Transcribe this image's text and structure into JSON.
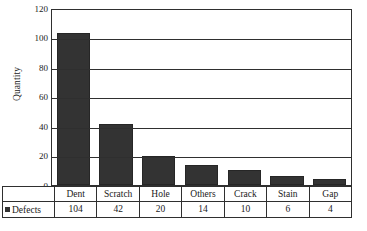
{
  "chart_data": {
    "type": "bar",
    "title": "",
    "xlabel": "",
    "ylabel": "Quantity",
    "categories": [
      "Dent",
      "Scratch",
      "Hole",
      "Others",
      "Crack",
      "Stain",
      "Gap"
    ],
    "values": [
      104,
      42,
      20,
      14,
      10,
      6,
      4
    ],
    "series": [
      {
        "name": "Defects",
        "values": [
          104,
          42,
          20,
          14,
          10,
          6,
          4
        ]
      }
    ],
    "ylim": [
      0,
      120
    ],
    "yticks": [
      0,
      20,
      40,
      60,
      80,
      100,
      120
    ],
    "ytick_labels": [
      "0",
      "20",
      "40",
      "60",
      "80",
      "100",
      "120"
    ],
    "grid": true,
    "grid_axis": "y",
    "legend": {
      "position": "data-table-row-header",
      "entries": [
        {
          "label": "Defects",
          "marker": "square",
          "color": "#333333"
        }
      ]
    },
    "bar_color": "#333333",
    "plot_background": "#ffffff",
    "axis_color": "#2f2f2f"
  },
  "axis": {
    "y_title": "Quantity"
  },
  "data_table": {
    "legend_label": "Defects",
    "header_row": [
      "Dent",
      "Scratch",
      "Hole",
      "Others",
      "Crack",
      "Stain",
      "Gap"
    ],
    "value_row": [
      "104",
      "42",
      "20",
      "14",
      "10",
      "6",
      "4"
    ]
  }
}
